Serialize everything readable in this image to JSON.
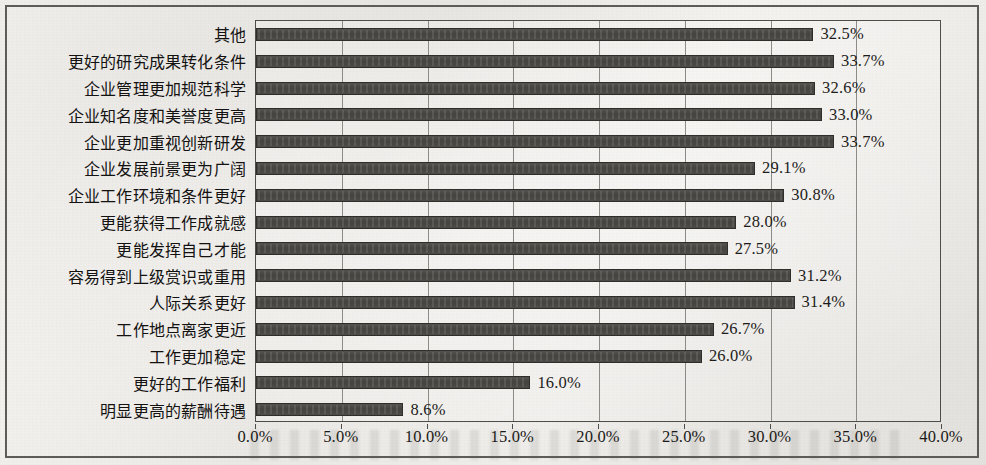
{
  "chart_data": {
    "type": "bar",
    "orientation": "horizontal",
    "title": "",
    "subtitle": "",
    "xlabel": "",
    "ylabel": "",
    "xlim": [
      0,
      40
    ],
    "xtick_step": 5,
    "grid": true,
    "legend": false,
    "value_label_suffix": "%",
    "bar_color": "#4a4844",
    "bar_edge_color": "#2f2e2b",
    "plot_border_color": "#4e4d4a",
    "grid_color": "#8d8b86",
    "background_color": "#f2f1ee",
    "categories": [
      "其他",
      "更好的研究成果转化条件",
      "企业管理更加规范科学",
      "企业知名度和美誉度更高",
      "企业更加重视创新研发",
      "企业发展前景更为广阔",
      "企业工作环境和条件更好",
      "更能获得工作成就感",
      "更能发挥自己才能",
      "容易得到上级赏识或重用",
      "人际关系更好",
      "工作地点离家更近",
      "工作更加稳定",
      "更好的工作福利",
      "明显更高的薪酬待遇"
    ],
    "values": [
      32.5,
      33.7,
      32.6,
      33.0,
      33.7,
      29.1,
      30.8,
      28.0,
      27.5,
      31.2,
      31.4,
      26.7,
      26.0,
      16.0,
      8.6
    ],
    "value_labels": [
      "32.5%",
      "33.7%",
      "32.6%",
      "33.0%",
      "33.7%",
      "29.1%",
      "30.8%",
      "28.0%",
      "27.5%",
      "31.2%",
      "31.4%",
      "26.7%",
      "26.0%",
      "16.0%",
      "8.6%"
    ],
    "xtick_labels": [
      "0.0%",
      "5.0%",
      "10.0%",
      "15.0%",
      "20.0%",
      "25.0%",
      "30.0%",
      "35.0%",
      "40.0%"
    ],
    "xtick_values": [
      0,
      5,
      10,
      15,
      20,
      25,
      30,
      35,
      40
    ]
  }
}
